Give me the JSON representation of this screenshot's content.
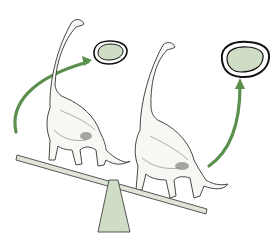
{
  "figure": {
    "colors": {
      "background": "#ffffff",
      "arrow": "#5a8f4e",
      "oval_fill": "#cfdcc6",
      "oval_stroke": "#111111",
      "beam_fill": "#dfe6d8",
      "fulcrum_fill": "#cfdcc6",
      "line_art": "#333333"
    },
    "elements": [
      {
        "name": "left-dinosaur",
        "kind": "sauropod illustration"
      },
      {
        "name": "right-dinosaur",
        "kind": "sauropod illustration"
      },
      {
        "name": "small-oval",
        "kind": "double-outlined oval",
        "size": "small"
      },
      {
        "name": "large-oval",
        "kind": "double-outlined oval",
        "size": "large"
      },
      {
        "name": "left-arrow",
        "kind": "curved arrow",
        "direction": "to small oval"
      },
      {
        "name": "right-arrow",
        "kind": "curved arrow",
        "direction": "to large oval"
      },
      {
        "name": "seesaw-beam",
        "kind": "tilted plank"
      },
      {
        "name": "fulcrum",
        "kind": "trapezoid pivot"
      }
    ]
  }
}
